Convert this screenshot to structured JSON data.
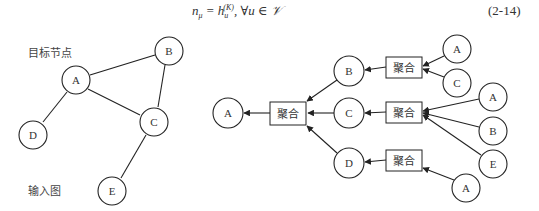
{
  "formula": {
    "text": "n_μ = h_u^(K), ∀u ∈ 𝒱",
    "lhs": "n",
    "lhs_sub": "μ",
    "eq": " = h",
    "h_sub": "u",
    "h_sup": "(K)",
    "rest": ", ∀u ∈ 𝒱",
    "number": "(2-14)"
  },
  "input_graph": {
    "target_label": "目标节点",
    "graph_label": "输入图",
    "nodes": [
      {
        "id": "A",
        "label": "A",
        "x": 76,
        "y": 80
      },
      {
        "id": "B",
        "label": "B",
        "x": 169,
        "y": 51
      },
      {
        "id": "C",
        "label": "C",
        "x": 154,
        "y": 122
      },
      {
        "id": "D",
        "label": "D",
        "x": 33,
        "y": 135
      },
      {
        "id": "E",
        "label": "E",
        "x": 112,
        "y": 191
      }
    ],
    "edges": [
      [
        "A",
        "B"
      ],
      [
        "A",
        "C"
      ],
      [
        "A",
        "D"
      ],
      [
        "B",
        "C"
      ],
      [
        "C",
        "E"
      ]
    ]
  },
  "computation_graph": {
    "aggregate_label": "聚合",
    "root": {
      "label": "A",
      "x": 228,
      "y": 113
    },
    "root_aggregate": {
      "x": 270,
      "y": 102,
      "w": 36,
      "h": 23
    },
    "level1": [
      {
        "label": "B",
        "x": 349,
        "y": 71,
        "aggregate": {
          "x": 386,
          "y": 57,
          "w": 36,
          "h": 21
        },
        "children": [
          {
            "label": "A",
            "x": 457,
            "y": 49
          },
          {
            "label": "C",
            "x": 457,
            "y": 83
          }
        ]
      },
      {
        "label": "C",
        "x": 349,
        "y": 113,
        "aggregate": {
          "x": 386,
          "y": 102,
          "w": 36,
          "h": 21
        },
        "children": [
          {
            "label": "A",
            "x": 493,
            "y": 97
          },
          {
            "label": "B",
            "x": 493,
            "y": 131
          },
          {
            "label": "E",
            "x": 493,
            "y": 164
          }
        ]
      },
      {
        "label": "D",
        "x": 349,
        "y": 163,
        "aggregate": {
          "x": 386,
          "y": 150,
          "w": 36,
          "h": 21
        },
        "children": [
          {
            "label": "A",
            "x": 466,
            "y": 188
          }
        ]
      }
    ]
  }
}
